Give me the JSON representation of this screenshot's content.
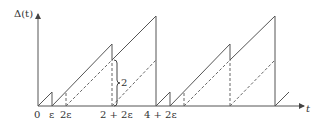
{
  "diagram": {
    "y_label": "Δ(t)",
    "x_label": "t",
    "bracket_label": "2",
    "x_ticks": [
      "0",
      "ε",
      "2ε",
      "2 + 2ε",
      "4 + 2ε"
    ],
    "line_color": "#444444"
  }
}
